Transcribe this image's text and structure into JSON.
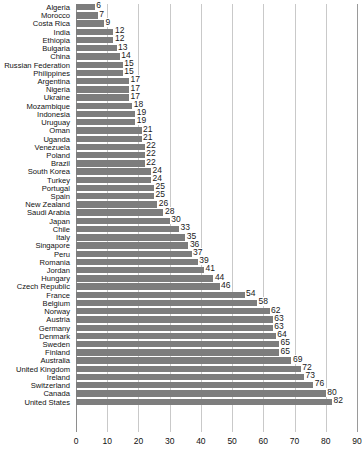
{
  "chart_data": {
    "type": "bar",
    "orientation": "horizontal",
    "title": "",
    "subtitle": "",
    "xlabel": "",
    "ylabel": "",
    "xlim": [
      0,
      90
    ],
    "xticks": [
      0,
      10,
      20,
      30,
      40,
      50,
      60,
      70,
      80,
      90
    ],
    "grid": true,
    "legend": null,
    "bar_color": "#7d7d7d",
    "gridline_color": "#c9c9c9",
    "categories": [
      "Algeria",
      "Morocco",
      "Costa Rica",
      "India",
      "Ethiopia",
      "Bulgaria",
      "China",
      "Russian Federation",
      "Philippines",
      "Argentina",
      "Nigeria",
      "Ukraine",
      "Mozambique",
      "Indonesia",
      "Uruguay",
      "Oman",
      "Uganda",
      "Venezuela",
      "Poland",
      "Brazil",
      "South Korea",
      "Turkey",
      "Portugal",
      "Spain",
      "New Zealand",
      "Saudi Arabia",
      "Japan",
      "Chile",
      "Italy",
      "Singapore",
      "Peru",
      "Romania",
      "Jordan",
      "Hungary",
      "Czech Republic",
      "France",
      "Belgium",
      "Norway",
      "Austria",
      "Germany",
      "Denmark",
      "Sweden",
      "Finland",
      "Australia",
      "United Kingdom",
      "Ireland",
      "Switzerland",
      "Canada",
      "United States"
    ],
    "values": [
      6,
      7,
      9,
      12,
      12,
      13,
      14,
      15,
      15,
      17,
      17,
      17,
      18,
      19,
      19,
      21,
      21,
      22,
      22,
      22,
      24,
      24,
      25,
      25,
      26,
      28,
      30,
      33,
      35,
      36,
      37,
      39,
      41,
      44,
      46,
      54,
      58,
      62,
      63,
      63,
      64,
      65,
      65,
      69,
      72,
      73,
      76,
      80,
      82
    ]
  }
}
